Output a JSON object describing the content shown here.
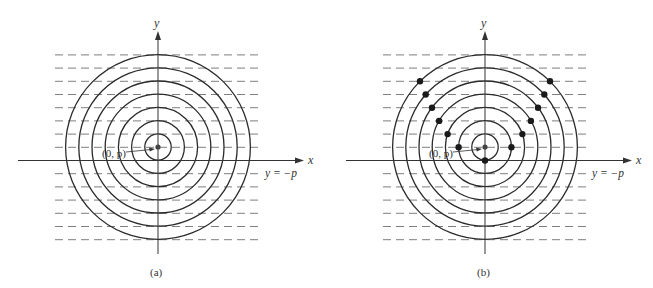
{
  "figure": {
    "unit_px": 13.2,
    "ring_count": 7,
    "colors": {
      "circle": "#2b2b2b",
      "axis": "#333333",
      "dash": "#6f6f6f",
      "dot": "#1a1a1a",
      "text": "#333333"
    }
  },
  "panels": [
    {
      "id": "a",
      "caption": "(a)",
      "focus_label": "(0, p)",
      "x_axis_label": "x",
      "y_axis_label": "y",
      "directrix_label": "y = −p",
      "show_parabola_points": false
    },
    {
      "id": "b",
      "caption": "(b)",
      "focus_label": "(0, p)",
      "x_axis_label": "x",
      "y_axis_label": "y",
      "directrix_label": "y = −p",
      "show_parabola_points": true
    }
  ]
}
